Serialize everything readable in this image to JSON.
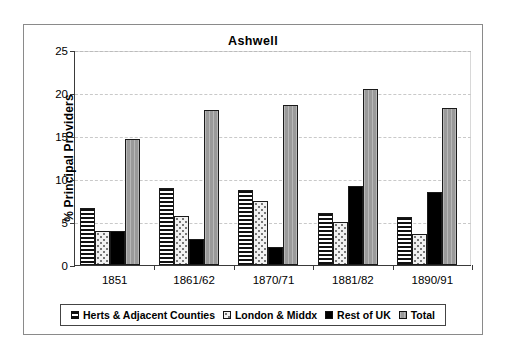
{
  "chart_data": {
    "type": "bar",
    "title": "Ashwell",
    "xlabel": "",
    "ylabel": "% Principal Providers",
    "ylim": [
      0,
      25
    ],
    "yticks": [
      0,
      5,
      10,
      15,
      20,
      25
    ],
    "grid": "horizontal-dashed",
    "legend_position": "bottom",
    "categories": [
      "1851",
      "1861/62",
      "1870/71",
      "1881/82",
      "1890/91"
    ],
    "series": [
      {
        "name": "Herts & Adjacent Counties",
        "pattern": "horizontal-stripes",
        "values": [
          6.6,
          8.9,
          8.7,
          6.0,
          5.6
        ]
      },
      {
        "name": "London & Middx",
        "pattern": "light-speckle",
        "values": [
          3.9,
          5.7,
          7.5,
          5.0,
          3.6
        ]
      },
      {
        "name": "Rest of UK",
        "pattern": "solid-black",
        "color": "#000000",
        "values": [
          3.9,
          3.0,
          2.1,
          9.2,
          8.5
        ]
      },
      {
        "name": "Total",
        "pattern": "solid-gray",
        "color": "#9a9a9a",
        "values": [
          14.7,
          18.0,
          18.6,
          20.5,
          18.2
        ]
      }
    ]
  },
  "legend": {
    "items": [
      {
        "label": "Herts & Adjacent Counties"
      },
      {
        "label": "London & Middx"
      },
      {
        "label": "Rest of UK"
      },
      {
        "label": "Total"
      }
    ]
  }
}
